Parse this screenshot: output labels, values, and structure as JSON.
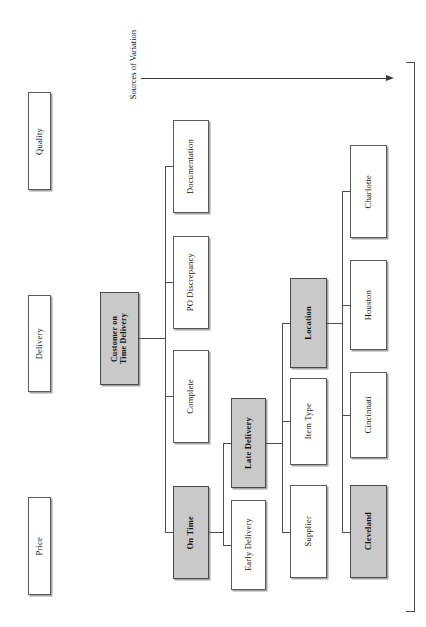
{
  "diagram": {
    "axis": {
      "label": "Sources of Variation",
      "arrow_name": "sources-of-variation-arrow"
    },
    "colors": {
      "shaded_fill": "#c9c9c9",
      "plain_fill": "#ffffff",
      "border": "#5a5a5a",
      "connector": "#4d4d4d"
    },
    "categories": [
      {
        "label": "Quality",
        "shaded": false
      },
      {
        "label": "Delivery",
        "shaded": false
      },
      {
        "label": "Price",
        "shaded": false
      }
    ],
    "level1": [
      {
        "label": "Customer on\nTime Delivery",
        "shaded": true
      }
    ],
    "level2": [
      {
        "label": "Documentation",
        "shaded": false
      },
      {
        "label": "PO Discrepancy",
        "shaded": false
      },
      {
        "label": "Complete",
        "shaded": false
      },
      {
        "label": "On Time",
        "shaded": true
      }
    ],
    "level3": [
      {
        "label": "Late Delivery",
        "shaded": true
      },
      {
        "label": "Early Delivery",
        "shaded": false
      }
    ],
    "level4": [
      {
        "label": "Location",
        "shaded": true
      },
      {
        "label": "Item Type",
        "shaded": false
      },
      {
        "label": "Supplier",
        "shaded": false
      }
    ],
    "level5": [
      {
        "label": "Charlotte",
        "shaded": false
      },
      {
        "label": "Houston",
        "shaded": false
      },
      {
        "label": "Cincinnati",
        "shaded": false
      },
      {
        "label": "Cleveland",
        "shaded": true
      }
    ]
  }
}
